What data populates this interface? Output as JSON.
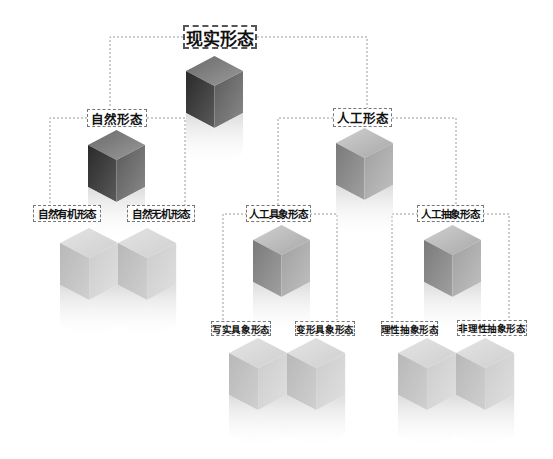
{
  "diagram": {
    "type": "hierarchy-tree",
    "root": {
      "label": "现实形态",
      "children": [
        {
          "label": "自然形态",
          "children": [
            {
              "label": "自然有机形态"
            },
            {
              "label": "自然无机形态"
            }
          ]
        },
        {
          "label": "人工形态",
          "children": [
            {
              "label": "人工具象形态",
              "children": [
                {
                  "label": "写实具象形态"
                },
                {
                  "label": "变形具象形态"
                }
              ]
            },
            {
              "label": "人工抽象形态",
              "children": [
                {
                  "label": "理性抽象形态"
                },
                {
                  "label": "非理性抽象形态"
                }
              ]
            }
          ]
        }
      ]
    },
    "nodes": {
      "real_form": "现实形态",
      "natural_form": "自然形态",
      "artificial_form": "人工形态",
      "natural_organic": "自然有机形态",
      "natural_inorganic": "自然无机形态",
      "artificial_concrete": "人工具象形态",
      "artificial_abstract": "人工抽象形态",
      "realistic_concrete": "写实具象形态",
      "deformed_concrete": "变形具象形态",
      "rational_abstract": "理性抽象形态",
      "irrational_abstract": "非理性抽象形态"
    },
    "colors": {
      "connector": "#999999",
      "label_border": "#777777",
      "text": "#111111",
      "cube_dark": "#3a3a3a",
      "cube_mid": "#8a8a8a",
      "cube_light": "#c8c8c8"
    }
  }
}
